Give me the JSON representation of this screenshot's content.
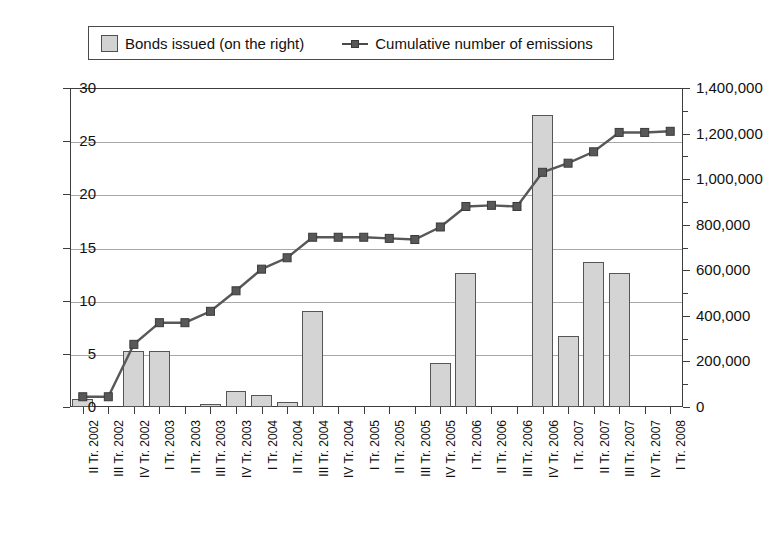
{
  "legend": {
    "bars_label": "Bonds issued (on the right)",
    "line_label": "Cumulative number of emissions",
    "bar_swatch_icon": "square-swatch-icon",
    "line_marker_icon": "line-marker-icon"
  },
  "chart_data": {
    "type": "bar",
    "title": "",
    "xlabel": "",
    "ylabel": "",
    "grid": true,
    "legend_position": "top",
    "categories": [
      "II Tr. 2002",
      "III Tr. 2002",
      "IV Tr. 2002",
      "I Tr. 2003",
      "II Tr. 2003",
      "III Tr. 2003",
      "IV Tr. 2003",
      "I Tr. 2004",
      "II Tr. 2004",
      "III Tr. 2004",
      "IV Tr. 2004",
      "I Tr. 2005",
      "II Tr. 2005",
      "III Tr. 2005",
      "IV Tr. 2005",
      "I Tr. 2006",
      "II Tr. 2006",
      "III Tr. 2006",
      "IV Tr. 2006",
      "I Tr. 2007",
      "II Tr. 2007",
      "III Tr. 2007",
      "IV Tr. 2007",
      "I Tr. 2008"
    ],
    "series": [
      {
        "name": "Bonds issued (on the right)",
        "type": "bar",
        "axis": "left",
        "color": "#d4d4d4",
        "values": [
          0.8,
          0,
          5.3,
          5.3,
          0,
          0.3,
          1.5,
          1.1,
          0.5,
          9.0,
          0,
          0,
          0,
          0,
          4.1,
          12.6,
          0,
          0,
          27.5,
          6.7,
          13.6,
          12.6,
          0,
          0
        ]
      },
      {
        "name": "Cumulative number of emissions",
        "type": "line",
        "axis": "right",
        "color": "#585858",
        "values": [
          45000,
          45000,
          275000,
          370000,
          370000,
          420000,
          510000,
          605000,
          655000,
          745000,
          745000,
          745000,
          740000,
          735000,
          790000,
          880000,
          885000,
          880000,
          1030000,
          1070000,
          1120000,
          1205000,
          1205000,
          1210000
        ]
      }
    ],
    "y_left": {
      "ticks": [
        0,
        5,
        10,
        15,
        20,
        25,
        30
      ],
      "labels": [
        "0",
        "5",
        "10",
        "15",
        "20",
        "25",
        "30"
      ],
      "ylim": [
        0,
        30
      ]
    },
    "y_right": {
      "ticks": [
        0,
        200000,
        400000,
        600000,
        800000,
        1000000,
        1200000,
        1400000
      ],
      "labels": [
        "0",
        "200,000",
        "400,000",
        "600,000",
        "800,000",
        "1,000,000",
        "1,200,000",
        "1,400,000"
      ],
      "ylim": [
        0,
        1400000
      ]
    }
  }
}
